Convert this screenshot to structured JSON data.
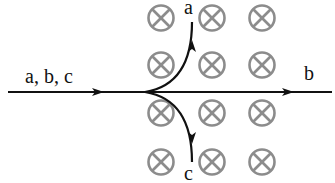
{
  "diagram": {
    "labels": {
      "incoming": "a, b, c",
      "particle_a": "a",
      "particle_b": "b",
      "particle_c": "c"
    },
    "field": {
      "symbol": "cross-in-circle-icon",
      "direction": "into page",
      "rows": 4,
      "columns": 3,
      "color": "#8c8c8c"
    },
    "paths": {
      "a": "curves upward",
      "b": "goes straight",
      "c": "curves downward"
    },
    "colors": {
      "line": "#111111",
      "field_symbol": "#8c8c8c",
      "background": "#ffffff"
    }
  }
}
